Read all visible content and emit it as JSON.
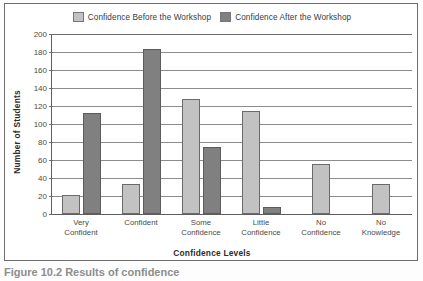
{
  "figure": {
    "caption": "Figure 10.2  Results of confidence"
  },
  "legend": {
    "position": "top-center",
    "entries": [
      {
        "label": "Confidence Before the Workshop",
        "color": "#c2c2c2"
      },
      {
        "label": "Confidence After the Workshop",
        "color": "#808080"
      }
    ]
  },
  "axes": {
    "ylabel": "Number of Students",
    "xlabel": "Confidence Levels",
    "yticks": [
      "200",
      "180",
      "160",
      "140",
      "120",
      "100",
      "80",
      "60",
      "40",
      "20",
      "0"
    ]
  },
  "chart_data": {
    "type": "bar",
    "title": "",
    "xlabel": "Confidence Levels",
    "ylabel": "Number of Students",
    "ylim": [
      0,
      200
    ],
    "ytick_step": 20,
    "grid": true,
    "legend_position": "top-center",
    "categories": [
      "Very Confident",
      "Confident",
      "Some Confidence",
      "Little Confidence",
      "No Confidence",
      "No Knowledge"
    ],
    "series": [
      {
        "name": "Confidence Before the Workshop",
        "color": "#c2c2c2",
        "values": [
          21,
          33,
          128,
          114,
          56,
          33
        ]
      },
      {
        "name": "Confidence After the Workshop",
        "color": "#808080",
        "values": [
          112,
          183,
          75,
          8,
          0,
          0
        ]
      }
    ]
  }
}
